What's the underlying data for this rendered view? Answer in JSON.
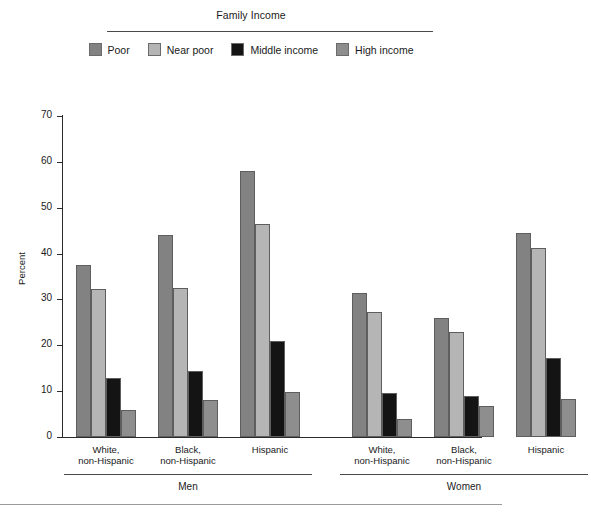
{
  "legend": {
    "title": "Family Income",
    "items": [
      {
        "label": "Poor",
        "color": "#828282"
      },
      {
        "label": "Near poor",
        "color": "#b5b5b5"
      },
      {
        "label": "Middle income",
        "color": "#141414"
      },
      {
        "label": "High income",
        "color": "#8e8e8e"
      }
    ]
  },
  "axis": {
    "ylabel": "Percent",
    "yticks": [
      "0",
      "10",
      "20",
      "30",
      "40",
      "50",
      "60",
      "70"
    ]
  },
  "sex_groups": [
    {
      "label": "Men"
    },
    {
      "label": "Women"
    }
  ],
  "race_groups": [
    {
      "line1": "White,",
      "line2": "non-Hispanic"
    },
    {
      "line1": "Black,",
      "line2": "non-Hispanic"
    },
    {
      "line1": "Hispanic",
      "line2": ""
    }
  ],
  "chart_data": {
    "type": "bar",
    "title": "Family Income",
    "xlabel": "",
    "ylabel": "Percent",
    "ylim": [
      0,
      70
    ],
    "ytick_step": 10,
    "grid": false,
    "legend_position": "top",
    "series": [
      {
        "name": "Poor",
        "color": "#828282",
        "values": [
          37.5,
          44.0,
          58.0,
          31.5,
          26.0,
          44.5
        ]
      },
      {
        "name": "Near poor",
        "color": "#b5b5b5",
        "values": [
          32.3,
          32.5,
          46.5,
          27.3,
          23.0,
          41.2
        ]
      },
      {
        "name": "Middle income",
        "color": "#141414",
        "values": [
          12.8,
          14.3,
          21.0,
          9.5,
          9.0,
          17.3
        ]
      },
      {
        "name": "High income",
        "color": "#8e8e8e",
        "values": [
          5.8,
          8.0,
          9.8,
          4.0,
          6.8,
          8.2
        ]
      }
    ],
    "categories": [
      "Men - White, non-Hispanic",
      "Men - Black, non-Hispanic",
      "Men - Hispanic",
      "Women - White, non-Hispanic",
      "Women - Black, non-Hispanic",
      "Women - Hispanic"
    ]
  }
}
